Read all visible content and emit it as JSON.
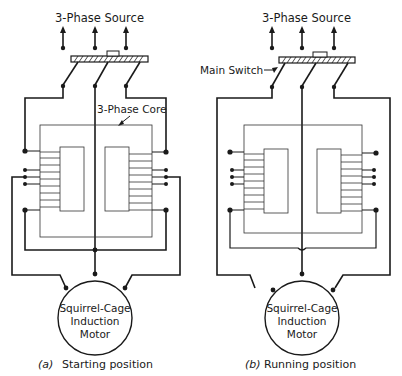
{
  "diagram": {
    "type": "autotransformer starter circuit",
    "panels": [
      {
        "id": "a",
        "source_label": "3-Phase Source",
        "core_label": "3-Phase Core",
        "motor_label_lines": [
          "Squirrel-Cage",
          "Induction",
          "Motor"
        ],
        "caption_prefix": "(a)",
        "caption": "Starting position"
      },
      {
        "id": "b",
        "source_label": "3-Phase Source",
        "switch_label": "Main Switch",
        "motor_label_lines": [
          "Squirrel-Cage",
          "Induction",
          "Motor"
        ],
        "caption_prefix": "(b)",
        "caption": "Running position"
      }
    ],
    "colors": {
      "line": "#1a1a1a",
      "background": "#ffffff"
    }
  }
}
